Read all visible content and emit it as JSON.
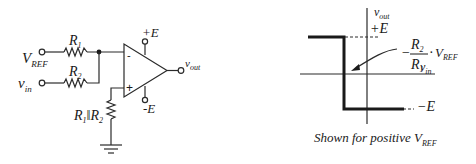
{
  "circuit": {
    "inputs": {
      "vref": {
        "main": "V",
        "sub": "REF"
      },
      "vin": {
        "main": "v",
        "sub": "in"
      }
    },
    "resistors": {
      "r1": {
        "main": "R",
        "sub": "1"
      },
      "r2": {
        "main": "R",
        "sub": "2"
      },
      "parallel": {
        "main1": "R",
        "sub1": "1",
        "sep": "‖",
        "main2": "R",
        "sub2": "2"
      }
    },
    "opamp": {
      "minus": "-",
      "plus": "+",
      "supply_pos": "+E",
      "supply_neg": "-E"
    },
    "output": {
      "main": "v",
      "sub": "out"
    }
  },
  "graph": {
    "y_axis": {
      "main": "v",
      "sub": "out"
    },
    "x_axis": {
      "main": "v",
      "sub": "in"
    },
    "level_high": "+E",
    "level_low": "−E",
    "threshold": {
      "minus": "−",
      "num_main": "R",
      "num_sub": "2",
      "den_main": "R",
      "den_sub": "1",
      "dot": "·",
      "v_main": "V",
      "v_sub": "REF"
    },
    "caption": {
      "text": "Shown for positive V",
      "sub": "REF"
    }
  }
}
